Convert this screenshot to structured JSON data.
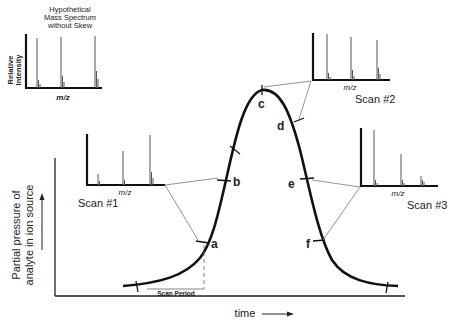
{
  "reference_spectrum": {
    "title_line1": "Hypothetical",
    "title_line2": "Mass Spectrum",
    "title_line3": "without Skew",
    "ylabel_line1": "Relative",
    "ylabel_line2": "Intensity",
    "xlabel": "m/z"
  },
  "scans": [
    {
      "label": "Scan #1",
      "xlabel": "m/z",
      "point": "b"
    },
    {
      "label": "Scan #2",
      "xlabel": "m/z",
      "point": "c"
    },
    {
      "label": "Scan #3",
      "xlabel": "m/z",
      "point": "e"
    }
  ],
  "points": [
    "a",
    "b",
    "c",
    "d",
    "e",
    "f"
  ],
  "scan_period_label": "Scan Period",
  "axes": {
    "xlabel": "time",
    "xarrow": "→",
    "ylabel_line1": "Partial pressure of",
    "ylabel_line2": "analyte in ion source"
  }
}
